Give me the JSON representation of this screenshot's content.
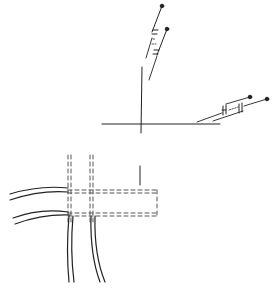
{
  "figure": {
    "type": "patent-line-drawing",
    "colors": {
      "background": "#ffffff",
      "line": "#222222",
      "dashed": "#555555"
    },
    "components": {
      "top_probe": "upper angled lead assembly with two pin terminals",
      "right_probe": "right angled lead assembly with two pin terminals",
      "crosshair": "vertical line meeting horizontal line",
      "dashed_frame": "dashed rectangular frame with two dashed vertical channels",
      "cables": "pairs of double-line curved cables entering from left and exiting downward"
    },
    "caption": ""
  }
}
